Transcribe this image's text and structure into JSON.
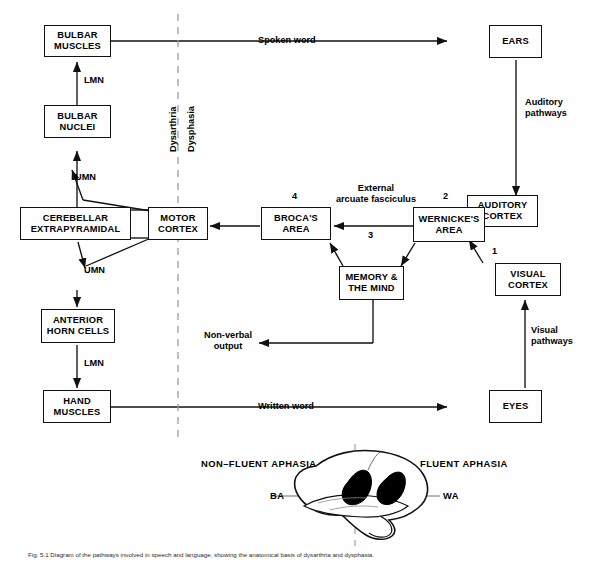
{
  "figure": {
    "caption": "Fig. 5.1  Diagram of the pathways involved in speech and language, showing the anatomical basis of dysarthria and dysphasia."
  },
  "divider": {
    "left_label": "Dysarthria",
    "right_label": "Dysphasia"
  },
  "nodes": [
    {
      "id": "bulbar-muscles",
      "label": "BULBAR\nMUSCLES"
    },
    {
      "id": "bulbar-nuclei",
      "label": "BULBAR\nNUCLEI"
    },
    {
      "id": "cerebellar",
      "label": "CEREBELLAR\nEXTRAPYRAMIDAL"
    },
    {
      "id": "motor-cortex",
      "label": "MOTOR\nCORTEX"
    },
    {
      "id": "anterior-horn",
      "label": "ANTERIOR\nHORN CELLS"
    },
    {
      "id": "hand-muscles",
      "label": "HAND\nMUSCLES"
    },
    {
      "id": "brocas-area",
      "label": "BROCA'S\nAREA"
    },
    {
      "id": "wernickes-area",
      "label": "WERNICKE'S\nAREA"
    },
    {
      "id": "auditory-cortex",
      "label": "AUDITORY\nCORTEX"
    },
    {
      "id": "visual-cortex",
      "label": "VISUAL\nCORTEX"
    },
    {
      "id": "memory-mind",
      "label": "MEMORY &\nTHE MIND"
    },
    {
      "id": "ears",
      "label": "EARS"
    },
    {
      "id": "eyes",
      "label": "EYES"
    }
  ],
  "edge_labels": {
    "lmn_upper": "LMN",
    "umn_upper": "UMN",
    "umn_lower": "UMN",
    "lmn_lower": "LMN",
    "spoken_word": "Spoken word",
    "written_word": "Written word",
    "auditory_pathways": "Auditory\npathways",
    "visual_pathways": "Visual\npathways",
    "external_arcuate": "External\narcuate fasciculus",
    "non_verbal_output": "Non-verbal\noutput"
  },
  "step_numbers": {
    "one": "1",
    "two": "2",
    "three": "3",
    "four": "4"
  },
  "brain": {
    "left_title": "NON–FLUENT APHASIA",
    "right_title": "FLUENT APHASIA",
    "left_axis": "BA",
    "right_axis": "WA"
  },
  "colors": {
    "stroke": "#111111",
    "background": "#ffffff",
    "lesion_fill": "#000000",
    "divider": "#9a9a9a"
  }
}
